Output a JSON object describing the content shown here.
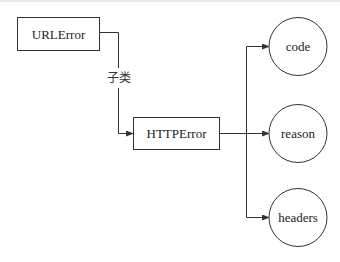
{
  "diagram": {
    "nodes": {
      "urlerror": {
        "label": "URLError",
        "shape": "rect"
      },
      "httperror": {
        "label": "HTTPError",
        "shape": "rect"
      },
      "code": {
        "label": "code",
        "shape": "circle"
      },
      "reason": {
        "label": "reason",
        "shape": "circle"
      },
      "headers": {
        "label": "headers",
        "shape": "circle"
      }
    },
    "edges": [
      {
        "from": "urlerror",
        "to": "httperror",
        "label": "子类"
      },
      {
        "from": "httperror",
        "to": "code",
        "label": ""
      },
      {
        "from": "httperror",
        "to": "reason",
        "label": ""
      },
      {
        "from": "httperror",
        "to": "headers",
        "label": ""
      }
    ],
    "edge_label_subclass": "子类",
    "colors": {
      "stroke": "#333333",
      "background": "#ffffff",
      "text": "#222222"
    }
  }
}
